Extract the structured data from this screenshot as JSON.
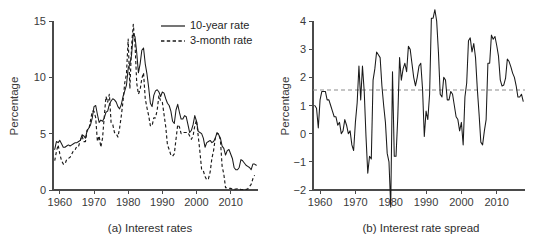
{
  "figure": {
    "panels": [
      {
        "id": "a",
        "caption": "(a) Interest rates"
      },
      {
        "id": "b",
        "caption": "(b) Interest rate spread"
      }
    ]
  },
  "chart_data": [
    {
      "type": "line",
      "panel_id": "a",
      "title": "(a) Interest rates",
      "xlabel": "",
      "ylabel": "Percentage",
      "xlim": [
        1958,
        2018
      ],
      "ylim": [
        0,
        15
      ],
      "xticks": [
        1960,
        1970,
        1980,
        1990,
        2000,
        2010
      ],
      "yticks": [
        0,
        5,
        10,
        15
      ],
      "grid": false,
      "legend_position": "top-right",
      "legend": [
        "10-year rate",
        "3-month rate"
      ],
      "x": [
        1958.5,
        1959.0,
        1959.5,
        1960.0,
        1960.5,
        1961.0,
        1961.5,
        1962.0,
        1962.5,
        1963.0,
        1963.5,
        1964.0,
        1964.5,
        1965.0,
        1965.5,
        1966.0,
        1966.5,
        1967.0,
        1967.5,
        1968.0,
        1968.5,
        1969.0,
        1969.5,
        1970.0,
        1970.5,
        1971.0,
        1971.5,
        1972.0,
        1972.5,
        1973.0,
        1973.5,
        1974.0,
        1974.5,
        1975.0,
        1975.5,
        1976.0,
        1976.5,
        1977.0,
        1977.5,
        1978.0,
        1978.5,
        1979.0,
        1979.5,
        1980.0,
        1980.5,
        1981.0,
        1981.5,
        1982.0,
        1982.5,
        1983.0,
        1983.5,
        1984.0,
        1984.5,
        1985.0,
        1985.5,
        1986.0,
        1986.5,
        1987.0,
        1987.5,
        1988.0,
        1988.5,
        1989.0,
        1989.5,
        1990.0,
        1990.5,
        1991.0,
        1991.5,
        1992.0,
        1992.5,
        1993.0,
        1993.5,
        1994.0,
        1994.5,
        1995.0,
        1995.5,
        1996.0,
        1996.5,
        1997.0,
        1997.5,
        1998.0,
        1998.5,
        1999.0,
        1999.5,
        2000.0,
        2000.5,
        2001.0,
        2001.5,
        2002.0,
        2002.5,
        2003.0,
        2003.5,
        2004.0,
        2004.5,
        2005.0,
        2005.5,
        2006.0,
        2006.5,
        2007.0,
        2007.5,
        2008.0,
        2008.5,
        2009.0,
        2009.5,
        2010.0,
        2010.5,
        2011.0,
        2011.5,
        2012.0,
        2012.5,
        2013.0,
        2013.5,
        2014.0,
        2014.5,
        2015.0,
        2015.5,
        2016.0,
        2016.5,
        2017.0,
        2017.5
      ],
      "series": [
        {
          "name": "10-year rate",
          "style": "solid",
          "values": [
            3.6,
            4.3,
            4.2,
            4.4,
            4.1,
            3.8,
            3.8,
            3.9,
            4.0,
            3.9,
            4.0,
            4.1,
            4.2,
            4.2,
            4.3,
            4.4,
            4.9,
            4.8,
            4.6,
            5.3,
            5.5,
            5.8,
            6.4,
            7.4,
            7.5,
            6.7,
            6.0,
            6.2,
            6.1,
            6.4,
            6.9,
            7.0,
            7.6,
            7.9,
            8.1,
            8.0,
            7.8,
            7.4,
            7.2,
            7.6,
            8.3,
            8.8,
            9.3,
            10.8,
            11.2,
            12.0,
            13.9,
            13.6,
            12.2,
            10.4,
            11.2,
            12.4,
            12.6,
            11.2,
            10.3,
            9.1,
            7.7,
            7.4,
            8.4,
            8.8,
            8.9,
            8.7,
            8.3,
            8.7,
            8.6,
            8.1,
            7.7,
            7.5,
            7.0,
            6.1,
            5.9,
            7.1,
            7.6,
            6.9,
            6.3,
            6.3,
            6.6,
            6.5,
            5.8,
            5.1,
            5.3,
            5.8,
            6.6,
            6.1,
            5.2,
            5.1,
            5.0,
            4.6,
            3.8,
            4.2,
            4.3,
            4.4,
            4.2,
            4.3,
            4.6,
            5.1,
            4.9,
            4.6,
            3.9,
            3.7,
            3.1,
            3.5,
            3.6,
            3.2,
            2.8,
            2.0,
            1.8,
            1.8,
            2.0,
            2.7,
            2.6,
            2.4,
            2.2,
            2.1,
            2.0,
            1.8,
            2.3,
            2.3,
            2.2,
            2.4,
            2.2
          ]
        },
        {
          "name": "3-month rate",
          "style": "dashed",
          "values": [
            2.6,
            3.4,
            4.0,
            3.2,
            2.6,
            2.3,
            2.3,
            2.7,
            2.8,
            2.9,
            3.2,
            3.5,
            3.6,
            3.9,
            3.9,
            4.4,
            4.8,
            4.3,
            4.3,
            5.3,
            5.4,
            6.2,
            7.0,
            7.0,
            6.4,
            4.3,
            4.8,
            3.8,
            4.6,
            6.5,
            8.3,
            7.8,
            8.5,
            6.0,
            5.8,
            5.1,
            5.0,
            4.7,
            5.5,
            6.6,
            7.9,
            9.5,
            10.3,
            13.4,
            9.0,
            12.8,
            14.7,
            13.0,
            9.5,
            8.5,
            8.9,
            9.9,
            10.4,
            8.1,
            7.3,
            6.6,
            5.7,
            5.7,
            6.4,
            6.4,
            7.1,
            8.4,
            7.9,
            7.8,
            6.7,
            5.6,
            4.0,
            3.6,
            3.1,
            3.0,
            3.2,
            4.5,
            5.8,
            5.6,
            5.0,
            5.1,
            5.1,
            5.1,
            5.1,
            4.8,
            4.5,
            4.8,
            5.7,
            6.2,
            4.8,
            3.4,
            1.8,
            1.7,
            1.2,
            0.9,
            1.0,
            1.6,
            2.8,
            3.5,
            4.6,
            5.0,
            5.0,
            4.4,
            2.1,
            1.4,
            0.2,
            0.2,
            0.15,
            0.15,
            0.07,
            0.05,
            0.09,
            0.11,
            0.07,
            0.05,
            0.04,
            0.03,
            0.05,
            0.1,
            0.3,
            0.5,
            1.0,
            1.3
          ]
        }
      ]
    },
    {
      "type": "line",
      "panel_id": "b",
      "title": "(b) Interest rate spread",
      "xlabel": "",
      "ylabel": "Percentage",
      "xlim": [
        1958,
        2018
      ],
      "ylim": [
        -2,
        4
      ],
      "xticks": [
        1960,
        1970,
        1980,
        1990,
        2000,
        2010
      ],
      "yticks": [
        -2,
        -1,
        0,
        1,
        2,
        3,
        4
      ],
      "grid": false,
      "annotations": [
        {
          "type": "hline",
          "value": 1.55,
          "style": "dashed",
          "color": "#8c8c8c",
          "label": "mean spread"
        }
      ],
      "x": [
        1958.5,
        1959.0,
        1959.5,
        1960.0,
        1960.5,
        1961.0,
        1961.5,
        1962.0,
        1962.5,
        1963.0,
        1963.5,
        1964.0,
        1964.5,
        1965.0,
        1965.5,
        1966.0,
        1966.5,
        1967.0,
        1967.5,
        1968.0,
        1968.5,
        1969.0,
        1969.5,
        1970.0,
        1970.5,
        1971.0,
        1971.5,
        1972.0,
        1972.5,
        1973.0,
        1973.5,
        1974.0,
        1974.5,
        1975.0,
        1975.5,
        1976.0,
        1976.5,
        1977.0,
        1977.5,
        1978.0,
        1978.5,
        1979.0,
        1979.5,
        1980.0,
        1980.5,
        1981.0,
        1981.5,
        1982.0,
        1982.5,
        1983.0,
        1983.5,
        1984.0,
        1984.5,
        1985.0,
        1985.5,
        1986.0,
        1986.5,
        1987.0,
        1987.5,
        1988.0,
        1988.5,
        1989.0,
        1989.5,
        1990.0,
        1990.5,
        1991.0,
        1991.5,
        1992.0,
        1992.5,
        1993.0,
        1993.5,
        1994.0,
        1994.5,
        1995.0,
        1995.5,
        1996.0,
        1996.5,
        1997.0,
        1997.5,
        1998.0,
        1998.5,
        1999.0,
        1999.5,
        2000.0,
        2000.5,
        2001.0,
        2001.5,
        2002.0,
        2002.5,
        2003.0,
        2003.5,
        2004.0,
        2004.5,
        2005.0,
        2005.5,
        2006.0,
        2006.5,
        2007.0,
        2007.5,
        2008.0,
        2008.5,
        2009.0,
        2009.5,
        2010.0,
        2010.5,
        2011.0,
        2011.5,
        2012.0,
        2012.5,
        2013.0,
        2013.5,
        2014.0,
        2014.5,
        2015.0,
        2015.5,
        2016.0,
        2016.5,
        2017.0,
        2017.5
      ],
      "series": [
        {
          "name": "10-year minus 3-month",
          "style": "solid",
          "values": [
            1.0,
            0.9,
            0.2,
            1.2,
            1.5,
            1.5,
            1.5,
            1.2,
            1.2,
            1.0,
            0.8,
            0.6,
            0.6,
            0.3,
            0.4,
            0.0,
            0.1,
            0.5,
            0.3,
            0.0,
            0.1,
            -0.4,
            -0.6,
            0.4,
            1.1,
            2.4,
            1.2,
            2.4,
            1.5,
            -0.1,
            -1.4,
            -0.8,
            -0.9,
            1.9,
            2.3,
            2.9,
            2.8,
            2.7,
            1.7,
            1.0,
            0.4,
            -0.7,
            -1.0,
            -2.6,
            2.2,
            -0.8,
            -0.8,
            0.6,
            2.7,
            1.9,
            2.3,
            2.5,
            2.2,
            3.1,
            3.0,
            2.5,
            2.0,
            1.7,
            2.0,
            2.4,
            2.5,
            1.6,
            -0.1,
            0.8,
            0.5,
            1.4,
            4.1,
            4.1,
            4.4,
            4.0,
            2.9,
            1.4,
            1.3,
            2.0,
            1.9,
            1.2,
            1.2,
            1.5,
            1.4,
            1.0,
            0.6,
            0.5,
            0.1,
            0.4,
            -0.4,
            1.3,
            1.8,
            3.3,
            3.4,
            2.9,
            3.2,
            2.7,
            1.6,
            0.7,
            -0.3,
            -0.4,
            0.1,
            0.5,
            2.5,
            2.5,
            3.5,
            3.35,
            3.45,
            3.13,
            2.75,
            1.91,
            1.69,
            1.73,
            1.97,
            2.65,
            2.56,
            2.37,
            2.15,
            2.0,
            1.7,
            1.3,
            1.3,
            1.4,
            1.15
          ]
        }
      ]
    }
  ]
}
